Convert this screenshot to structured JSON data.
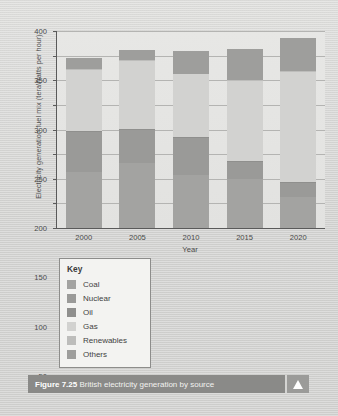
{
  "figure": {
    "number": "Figure 7.25",
    "caption": "British electricity generation by source",
    "expand_icon": "triangle-up-icon"
  },
  "legend": {
    "title": "Key",
    "items": [
      {
        "label": "Coal",
        "color": "#a3a3a1"
      },
      {
        "label": "Nuclear",
        "color": "#9a9a98"
      },
      {
        "label": "Oil",
        "color": "#8f8f8d"
      },
      {
        "label": "Gas",
        "color": "#d2d2d0"
      },
      {
        "label": "Renewables",
        "color": "#bdbdbb"
      },
      {
        "label": "Others",
        "color": "#9e9e9c"
      }
    ]
  },
  "chart_data": {
    "type": "bar",
    "stacked": true,
    "title": "British electricity generation by source",
    "xlabel": "Year",
    "ylabel": "Electricity generation fuel mix (teraWatts per hour)",
    "categories": [
      "2000",
      "2005",
      "2010",
      "2015",
      "2020"
    ],
    "ylim": [
      0,
      400
    ],
    "yticks": [
      0,
      50,
      100,
      150,
      200,
      250,
      300,
      350,
      400
    ],
    "grid": true,
    "legend_position": "below-left",
    "series": [
      {
        "name": "Coal",
        "color": "#a3a3a1",
        "values": [
          113,
          131,
          108,
          100,
          62
        ]
      },
      {
        "name": "Nuclear",
        "color": "#9a9a98",
        "values": [
          82,
          69,
          74,
          34,
          30
        ]
      },
      {
        "name": "Oil",
        "color": "#8f8f8d",
        "values": [
          3,
          2,
          2,
          2,
          2
        ]
      },
      {
        "name": "Gas",
        "color": "#d2d2d0",
        "values": [
          122,
          137,
          128,
          163,
          223
        ]
      },
      {
        "name": "Renewables",
        "color": "#bdbdbb",
        "values": [
          2,
          3,
          1,
          1,
          1
        ]
      },
      {
        "name": "Others",
        "color": "#9e9e9c",
        "values": [
          23,
          19,
          47,
          64,
          68
        ]
      }
    ],
    "totals": [
      345,
      361,
      360,
      364,
      386
    ]
  }
}
